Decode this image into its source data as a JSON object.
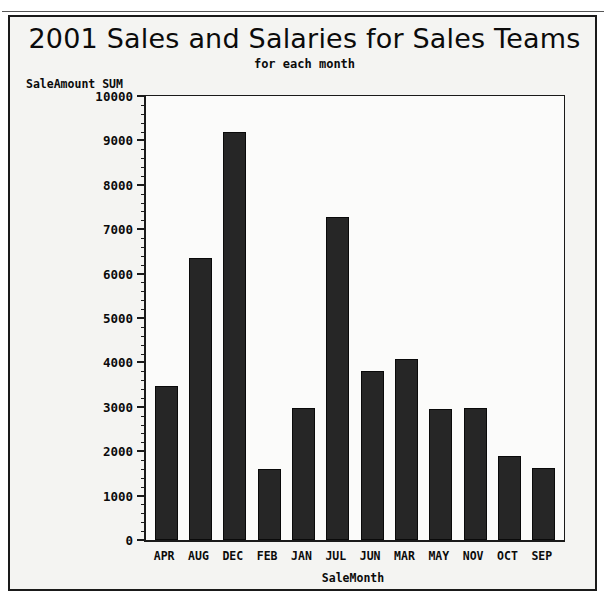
{
  "scan": {
    "top_fragment_text": ""
  },
  "chart_data": {
    "type": "bar",
    "title": "2001 Sales and Salaries for Sales Teams",
    "subtitle": "for each month",
    "xlabel": "SaleMonth",
    "ylabel": "SaleAmount SUM",
    "ylim": [
      0,
      10000
    ],
    "ytick_step": 1000,
    "yminor_step": 200,
    "grid": false,
    "legend": null,
    "bar_color": "#262626",
    "plot_background": "#fbfbfa",
    "frame_color": "#1a1a1a",
    "categories": [
      "APR",
      "AUG",
      "DEC",
      "FEB",
      "JAN",
      "JUL",
      "JUN",
      "MAR",
      "MAY",
      "NOV",
      "OCT",
      "SEP"
    ],
    "values": [
      3460,
      6350,
      9200,
      1600,
      2970,
      7280,
      3810,
      4080,
      2940,
      2980,
      1900,
      1630
    ],
    "ytick_labels": [
      "10000",
      "9000",
      "8000",
      "7000",
      "6000",
      "5000",
      "4000",
      "3000",
      "2000",
      "1000",
      "0"
    ],
    "ytick_values": [
      10000,
      9000,
      8000,
      7000,
      6000,
      5000,
      4000,
      3000,
      2000,
      1000,
      0
    ]
  }
}
